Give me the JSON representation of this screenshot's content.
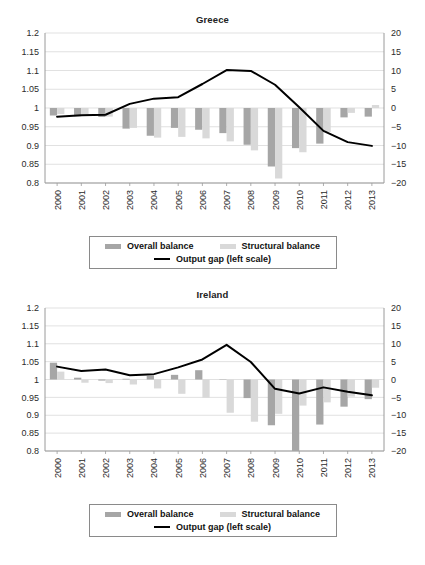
{
  "figure": {
    "panels": [
      {
        "title": "Greece"
      },
      {
        "title": "Ireland"
      }
    ],
    "legend": {
      "overall_label": "Overall balance",
      "structural_label": "Structural balance",
      "outputgap_label": "Output gap (left scale)",
      "overall_color": "#a6a6a6",
      "structural_color": "#d9d9d9",
      "outputgap_color": "#000000"
    }
  },
  "chart_data": [
    {
      "type": "bar",
      "title": "Greece",
      "xlabel": "",
      "ylabel": "",
      "categories": [
        "2000",
        "2001",
        "2002",
        "2003",
        "2004",
        "2005",
        "2006",
        "2007",
        "2008",
        "2009",
        "2010",
        "2011",
        "2012",
        "2013"
      ],
      "left_axis": {
        "ticks": [
          "1.2",
          "1.15",
          "1.1",
          "1.05",
          "1",
          "0.95",
          "0.9",
          "0.85",
          "0.8"
        ],
        "tick_values": [
          1.2,
          1.15,
          1.1,
          1.05,
          1,
          0.95,
          0.9,
          0.85,
          0.8
        ],
        "ylim": [
          0.8,
          1.2
        ]
      },
      "right_axis": {
        "ticks": [
          "20",
          "15",
          "10",
          "5",
          "0",
          "-5",
          "-10",
          "-15",
          "-20"
        ],
        "tick_values": [
          20,
          15,
          10,
          5,
          0,
          -5,
          -10,
          -15,
          -20
        ],
        "ylim": [
          -20,
          20
        ]
      },
      "grid": true,
      "legend_position": "below",
      "series": [
        {
          "name": "Overall balance",
          "axis": "right",
          "type": "bar",
          "color": "#a6a6a6",
          "values": [
            -2.0,
            -2.2,
            -2.4,
            -5.5,
            -7.4,
            -5.3,
            -5.8,
            -6.7,
            -9.8,
            -15.6,
            -10.7,
            -9.5,
            -2.5,
            -2.3
          ]
        },
        {
          "name": "Structural balance",
          "axis": "right",
          "type": "bar",
          "color": "#d9d9d9",
          "values": [
            -1.6,
            -1.8,
            -2.3,
            -5.3,
            -7.9,
            -7.7,
            -8.1,
            -8.9,
            -11.3,
            -18.8,
            -11.8,
            -6.4,
            -1.3,
            0.8
          ]
        },
        {
          "name": "Output gap (left scale)",
          "axis": "right",
          "type": "line",
          "color": "#000000",
          "values": [
            -2.3,
            -1.9,
            -1.8,
            1.1,
            2.5,
            2.9,
            6.4,
            10.1,
            9.9,
            6.2,
            0.2,
            -6.1,
            -9.1,
            -10.1
          ]
        }
      ]
    },
    {
      "type": "bar",
      "title": "Ireland",
      "xlabel": "",
      "ylabel": "",
      "categories": [
        "2000",
        "2001",
        "2002",
        "2003",
        "2004",
        "2005",
        "2006",
        "2007",
        "2008",
        "2009",
        "2010",
        "2011",
        "2012",
        "2013"
      ],
      "left_axis": {
        "ticks": [
          "1.2",
          "1.15",
          "1.1",
          "1.05",
          "1",
          "0.95",
          "0.9",
          "0.85",
          "0.8"
        ],
        "tick_values": [
          1.2,
          1.15,
          1.1,
          1.05,
          1,
          0.95,
          0.9,
          0.85,
          0.8
        ],
        "ylim": [
          0.8,
          1.2
        ]
      },
      "right_axis": {
        "ticks": [
          "20",
          "15",
          "10",
          "5",
          "0",
          "-5",
          "-10",
          "-15",
          "-20"
        ],
        "tick_values": [
          20,
          15,
          10,
          5,
          0,
          -5,
          -10,
          -15,
          -20
        ],
        "ylim": [
          -20,
          20
        ]
      },
      "grid": true,
      "legend_position": "below",
      "series": [
        {
          "name": "Overall balance",
          "axis": "right",
          "type": "bar",
          "color": "#a6a6a6",
          "values": [
            4.7,
            0.5,
            -0.3,
            0.2,
            1.0,
            1.3,
            2.6,
            -0.1,
            -5.2,
            -12.8,
            -30.5,
            -12.6,
            -7.6,
            -5.5
          ]
        },
        {
          "name": "Structural balance",
          "axis": "right",
          "type": "bar",
          "color": "#d9d9d9",
          "values": [
            2.2,
            -0.9,
            -1.0,
            -1.4,
            -2.5,
            -4.0,
            -5.1,
            -9.3,
            -11.8,
            -9.6,
            -7.3,
            -6.4,
            -4.8,
            -2.3
          ]
        },
        {
          "name": "Output gap (left scale)",
          "axis": "right",
          "type": "line",
          "color": "#000000",
          "values": [
            3.6,
            2.4,
            2.8,
            1.2,
            1.5,
            3.4,
            5.6,
            9.7,
            4.9,
            -2.6,
            -3.9,
            -2.2,
            -3.4,
            -4.4
          ]
        }
      ]
    }
  ]
}
